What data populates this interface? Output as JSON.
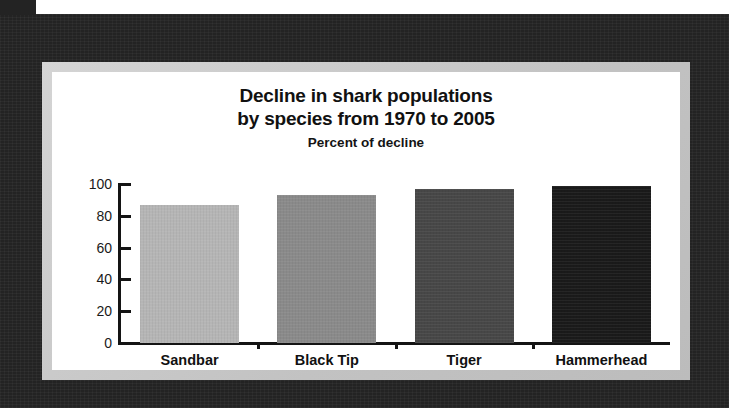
{
  "chart_data": {
    "type": "bar",
    "title": "Decline in shark populations by species from 1970 to 2005",
    "title_lines": [
      "Decline in shark populations",
      "by species from 1970 to 2005"
    ],
    "subtitle": "Percent of decline",
    "xlabel": "",
    "ylabel": "Percent of decline",
    "categories": [
      "Sandbar",
      "Black Tip",
      "Tiger",
      "Hammerhead"
    ],
    "values": [
      87,
      93,
      97,
      99
    ],
    "ylim": [
      0,
      100
    ],
    "yticks": [
      0,
      20,
      40,
      60,
      80,
      100
    ],
    "ytick_labels": [
      "0",
      "20",
      "40",
      "60",
      "80",
      "100"
    ],
    "grid": false,
    "legend": "none",
    "bar_colors": [
      "#b5b5b5",
      "#8a8a8a",
      "#474747",
      "#1a1a1a"
    ],
    "series": [
      {
        "name": "Percent of decline",
        "values": [
          87,
          93,
          97,
          99
        ]
      }
    ]
  },
  "figure": {
    "frame_color": "#232323",
    "mount_color": "#c9c9c9",
    "panel_color": "#ffffff",
    "axis_color": "#141414",
    "text_color": "#111111"
  }
}
